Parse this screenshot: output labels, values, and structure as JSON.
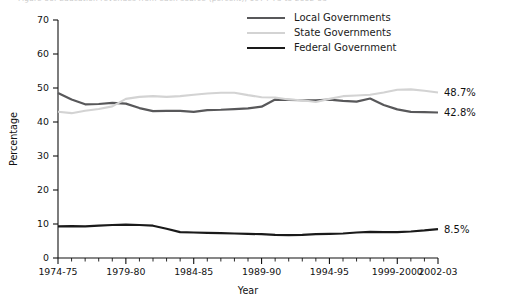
{
  "figure": {
    "caption": "Figure 00.  Education revenues from each source (percent), 1974-75 to 2002-03"
  },
  "legend": {
    "items": [
      {
        "label": "Local Governments",
        "color": "#58585a",
        "width": 2.2
      },
      {
        "label": "State Governments",
        "color": "#d3d3d3",
        "width": 2.2
      },
      {
        "label": "Federal Government",
        "color": "#1a1a1a",
        "width": 2.2
      }
    ]
  },
  "chart_data": {
    "type": "line",
    "title": "",
    "xlabel": "Year",
    "ylabel": "Percentage",
    "ylim": [
      0,
      70
    ],
    "yticks": [
      0,
      10,
      20,
      30,
      40,
      50,
      60,
      70
    ],
    "grid": false,
    "legend_position": "top-right",
    "x": [
      "1974-75",
      "1975-76",
      "1976-77",
      "1977-78",
      "1978-79",
      "1979-80",
      "1980-81",
      "1981-82",
      "1982-83",
      "1983-84",
      "1984-85",
      "1985-86",
      "1986-87",
      "1987-88",
      "1988-89",
      "1989-90",
      "1990-91",
      "1991-92",
      "1992-93",
      "1993-94",
      "1994-95",
      "1995-96",
      "1996-97",
      "1997-98",
      "1998-99",
      "1999-2000",
      "2000-01",
      "2001-02",
      "2002-03"
    ],
    "xtick_labels": [
      "1974-75",
      "1979-80",
      "1984-85",
      "1989-90",
      "1994-95",
      "1999-2000",
      "2002-03"
    ],
    "xtick_positions": [
      0,
      5,
      10,
      15,
      20,
      25,
      28
    ],
    "series": [
      {
        "name": "Local Governments",
        "color": "#58585a",
        "end_label": "42.8%",
        "values": [
          48.5,
          46.6,
          45.2,
          45.3,
          45.6,
          45.4,
          44.1,
          43.2,
          43.3,
          43.3,
          43.0,
          43.5,
          43.6,
          43.8,
          44.0,
          44.5,
          46.6,
          46.5,
          46.4,
          46.4,
          46.6,
          46.2,
          46.0,
          46.9,
          45.0,
          43.7,
          43.0,
          42.9,
          42.8
        ]
      },
      {
        "name": "State Governments",
        "color": "#d3d3d3",
        "end_label": "48.7%",
        "values": [
          43.0,
          42.6,
          43.3,
          43.8,
          44.6,
          46.8,
          47.4,
          47.6,
          47.4,
          47.6,
          48.0,
          48.4,
          48.6,
          48.6,
          47.9,
          47.3,
          47.2,
          46.6,
          46.4,
          45.9,
          46.8,
          47.6,
          47.8,
          48.0,
          48.7,
          49.5,
          49.6,
          49.2,
          48.7
        ]
      },
      {
        "name": "Federal Government",
        "color": "#1a1a1a",
        "end_label": "8.5%",
        "values": [
          9.3,
          9.4,
          9.3,
          9.5,
          9.7,
          9.8,
          9.7,
          9.5,
          8.6,
          7.6,
          7.5,
          7.4,
          7.3,
          7.2,
          7.1,
          7.0,
          6.8,
          6.7,
          6.8,
          7.0,
          7.1,
          7.2,
          7.5,
          7.7,
          7.6,
          7.6,
          7.8,
          8.1,
          8.5
        ]
      }
    ]
  }
}
